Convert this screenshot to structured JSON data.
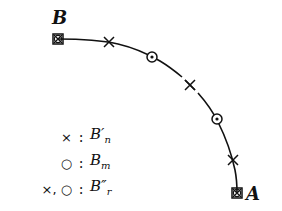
{
  "diagram": {
    "type": "arc-with-markers",
    "points": {
      "B": {
        "label": "B",
        "marker": "square-with-x-and-circle",
        "x": 58,
        "y": 39
      },
      "A": {
        "label": "A",
        "marker": "square-with-x-and-circle",
        "x": 237,
        "y": 193
      }
    },
    "markers": [
      {
        "symbol": "x",
        "x": 109,
        "y": 42
      },
      {
        "symbol": "o",
        "x": 152,
        "y": 57
      },
      {
        "symbol": "x",
        "x": 190,
        "y": 85
      },
      {
        "symbol": "o",
        "x": 217,
        "y": 119
      },
      {
        "symbol": "x",
        "x": 233,
        "y": 160
      }
    ],
    "labels": {
      "B": "B",
      "A": "A"
    }
  },
  "legend": {
    "rows": [
      {
        "symbol": "×",
        "colon": ":",
        "base": "B",
        "sup": "′",
        "sub": "n"
      },
      {
        "symbol": "○",
        "colon": ":",
        "base": "B",
        "sup": "",
        "sub": "m"
      },
      {
        "symbol": "×, ○",
        "colon": ":",
        "base": "B",
        "sup": "″",
        "sub": "r"
      }
    ]
  },
  "colors": {
    "ink": "#111111",
    "background": "#ffffff"
  }
}
